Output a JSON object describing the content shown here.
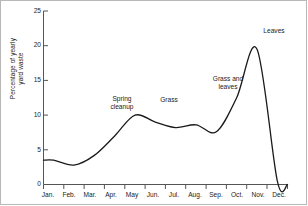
{
  "chart_data": {
    "type": "line",
    "title": "",
    "xlabel": "",
    "ylabel_line1": "Percentage of yearly",
    "ylabel_line2": "yard waste",
    "ylabel": "Percentage of yearly yard waste",
    "categories": [
      "Jan.",
      "Feb.",
      "Mar.",
      "Apr.",
      "May",
      "Jun.",
      "Jul.",
      "Aug.",
      "Sep.",
      "Oct.",
      "Nov.",
      "Dec."
    ],
    "values": [
      3.5,
      2.8,
      4.2,
      7.0,
      10.0,
      9.0,
      8.2,
      8.6,
      7.6,
      12.5,
      19.5,
      0.5
    ],
    "ylim": [
      0,
      25
    ],
    "yticks": [
      0,
      5,
      10,
      15,
      20,
      25
    ],
    "ytick_labels": [
      "0",
      "5",
      "10",
      "15",
      "20",
      "25"
    ],
    "grid": false,
    "legend": "none",
    "line_color": "#1a1a1a",
    "axis_color": "#555555",
    "annotations": [
      {
        "text_line1": "Spring",
        "text_line2": "cleanup",
        "text": "Spring cleanup",
        "near_month": "Apr."
      },
      {
        "text_line1": "Grass",
        "text_line2": "",
        "text": "Grass",
        "near_month": "Jun."
      },
      {
        "text_line1": "Grass and",
        "text_line2": "leaves",
        "text": "Grass and leaves",
        "near_month": "Aug."
      },
      {
        "text_line1": "Leaves",
        "text_line2": "",
        "text": "Leaves",
        "near_month": "Nov."
      }
    ]
  }
}
